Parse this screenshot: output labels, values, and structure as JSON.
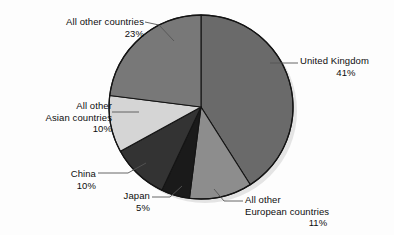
{
  "chart_data": {
    "type": "pie",
    "title": "",
    "subtitle": "",
    "xlabel": "",
    "ylabel": "",
    "legend_position": "none",
    "grid": false,
    "start_angle_deg": 0,
    "direction": "clockwise",
    "categories": [
      "United Kingdom",
      "All other European countries",
      "Japan",
      "China",
      "All other Asian countries",
      "All other countries"
    ],
    "values": [
      41,
      11,
      5,
      10,
      10,
      23
    ],
    "value_unit": "%",
    "colors": [
      "#6a6a6a",
      "#8d8d8d",
      "#1a1a1a",
      "#333333",
      "#d5d5d5",
      "#787878"
    ],
    "slices": [
      {
        "name": "United Kingdom",
        "label_lines": [
          "United Kingdom",
          "41%"
        ],
        "value": 41,
        "value_text": "41%",
        "color": "#6a6a6a"
      },
      {
        "name": "All other European countries",
        "label_lines": [
          "All other",
          "European countries",
          "11%"
        ],
        "value": 11,
        "value_text": "11%",
        "color": "#8d8d8d"
      },
      {
        "name": "Japan",
        "label_lines": [
          "Japan",
          "5%"
        ],
        "value": 5,
        "value_text": "5%",
        "color": "#1a1a1a"
      },
      {
        "name": "China",
        "label_lines": [
          "China",
          "10%"
        ],
        "value": 10,
        "value_text": "10%",
        "color": "#333333"
      },
      {
        "name": "All other Asian countries",
        "label_lines": [
          "All other",
          "Asian countries",
          "10%"
        ],
        "value": 10,
        "value_text": "10%",
        "color": "#d5d5d5"
      },
      {
        "name": "All other countries",
        "label_lines": [
          "All other countries",
          "23%"
        ],
        "value": 23,
        "value_text": "23%",
        "color": "#787878"
      }
    ]
  },
  "annotations": {
    "all_other_countries": {
      "line1": "All other countries",
      "line2": "23%"
    },
    "united_kingdom": {
      "line1": "United Kingdom",
      "line2": "41%"
    },
    "all_other_asian": {
      "line1": "All other",
      "line2": "Asian countries",
      "line3": "10%"
    },
    "china": {
      "line1": "China",
      "line2": "10%"
    },
    "japan": {
      "line1": "Japan",
      "line2": "5%"
    },
    "all_other_european": {
      "line1": "All other",
      "line2": "European countries",
      "line3": "11%"
    }
  },
  "style": {
    "background": "#fdfdfd",
    "outline": "#141414",
    "text_color": "#0d0d0d",
    "leader_color": "#555555"
  }
}
